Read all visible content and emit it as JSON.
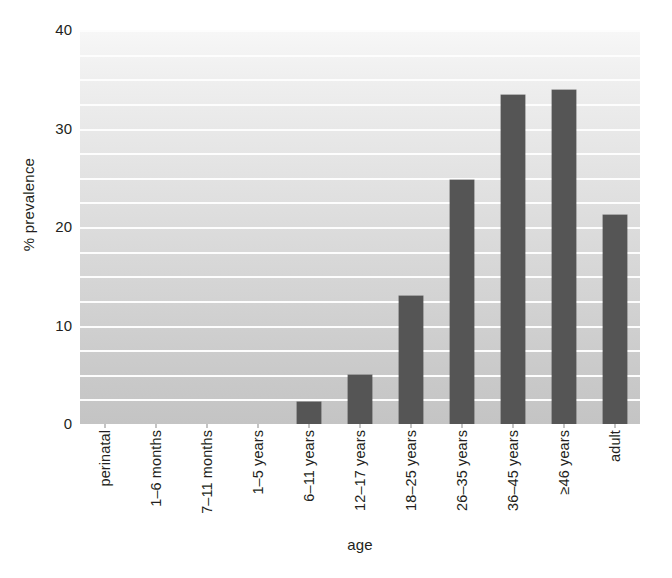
{
  "chart_data": {
    "type": "bar",
    "title": "",
    "xlabel": "age",
    "ylabel": "% prevalence",
    "categories": [
      "perinatal",
      "1–6 months",
      "7–11 months",
      "1–5 years",
      "6–11 years",
      "12–17 years",
      "18–25 years",
      "26–35 years",
      "36–45 years",
      "≥46 years",
      "adult"
    ],
    "values": [
      0,
      0,
      0,
      0,
      2.2,
      5.0,
      13.0,
      24.8,
      33.4,
      33.9,
      21.2
    ],
    "ylim": [
      0,
      40
    ],
    "yticks": [
      0,
      10,
      20,
      30,
      40
    ],
    "ytick_labels": [
      "0",
      "10",
      "20",
      "30",
      "40"
    ],
    "gridlines_minor_step": 2.5,
    "grid": true,
    "legend": "none",
    "bar_color": "#555555",
    "grid_color": "#fdfdfd",
    "plot_background": "gray vertical gradient, light at top to darker at bottom"
  }
}
